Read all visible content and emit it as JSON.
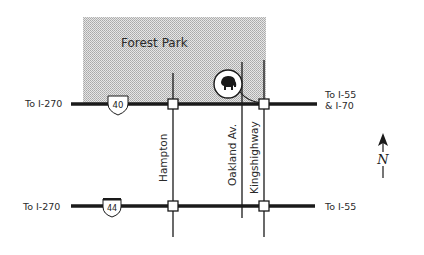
{
  "map": {
    "park": {
      "label": "Forest Park",
      "fill": "#d2d2d2"
    },
    "roads": {
      "top": {
        "left_label": "To I-270",
        "right_label_line1": "To I-55",
        "right_label_line2": "& I-70",
        "shield": "40"
      },
      "bottom": {
        "left_label": "To I-270",
        "right_label": "To I-55",
        "shield": "44"
      }
    },
    "streets": [
      {
        "label": "Hampton"
      },
      {
        "label": "Oakland Av."
      },
      {
        "label": "Kingshighway"
      }
    ],
    "landmark": {
      "icon": "elephant-zoo-icon"
    },
    "compass": {
      "letter": "N",
      "icon": "north-arrow-icon"
    },
    "colors": {
      "road": "#1a1a1a",
      "park": "#d2d2d2",
      "background": "#ffffff"
    }
  }
}
